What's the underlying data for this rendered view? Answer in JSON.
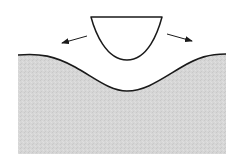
{
  "diagram": {
    "colors": {
      "background": "#ffffff",
      "substrate_fill": "#d4d4d4",
      "outline": "#1a1a1a"
    },
    "elements": {
      "substrate": {
        "label": ""
      },
      "surface_profile": {
        "label": ""
      },
      "indenter": {
        "label": ""
      },
      "arrow_left": {
        "direction": "left-down",
        "label": ""
      },
      "arrow_right": {
        "direction": "right-down",
        "label": ""
      }
    }
  }
}
